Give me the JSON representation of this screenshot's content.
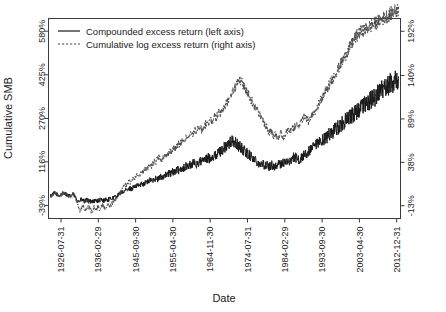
{
  "chart_data": {
    "type": "line",
    "title": "",
    "xlabel": "Date",
    "ylabel": "Cumulative SMB",
    "grid": false,
    "legend_position": "top-left",
    "x_tick_labels": [
      "1926-07-31",
      "1936-02-29",
      "1945-09-30",
      "1955-04-30",
      "1964-11-30",
      "1974-07-31",
      "1984-02-29",
      "1993-09-30",
      "2003-04-30",
      "2012-12-31"
    ],
    "y_left_tick_labels": [
      "-39%",
      "116%",
      "270%",
      "425%",
      "580%"
    ],
    "y_left_values": [
      -39,
      116,
      270,
      425,
      580
    ],
    "y_right_tick_labels": [
      "-13%",
      "38%",
      "89%",
      "140%",
      "192%"
    ],
    "y_right_values": [
      -13,
      38,
      89,
      140,
      192
    ],
    "ylim_left": [
      -85,
      625
    ],
    "ylim_right": [
      -28,
      207
    ],
    "series": [
      {
        "name": "Compounded excess return (left axis)",
        "axis": "left",
        "style": "solid",
        "color": "#1a1a1a",
        "values": [
          -5,
          -2,
          2,
          5,
          3,
          0,
          -4,
          -2,
          1,
          4,
          6,
          3,
          0,
          -3,
          -6,
          -4,
          -1,
          2,
          -8,
          -14,
          -20,
          -24,
          -22,
          -18,
          -21,
          -25,
          -23,
          -19,
          -22,
          -26,
          -24,
          -21,
          -24,
          -22,
          -20,
          -23,
          -21,
          -18,
          -20,
          -22,
          -19,
          -17,
          -20,
          -18,
          -16,
          -14,
          -12,
          -10,
          -8,
          -5,
          -2,
          2,
          6,
          10,
          8,
          12,
          16,
          14,
          18,
          22,
          20,
          24,
          28,
          26,
          30,
          34,
          32,
          36,
          40,
          38,
          42,
          46,
          44,
          48,
          52,
          50,
          54,
          58,
          56,
          52,
          56,
          60,
          64,
          62,
          66,
          70,
          68,
          72,
          76,
          74,
          78,
          82,
          80,
          84,
          88,
          86,
          90,
          94,
          92,
          96,
          100,
          98,
          102,
          106,
          104,
          108,
          112,
          110,
          106,
          110,
          114,
          118,
          116,
          120,
          124,
          122,
          126,
          130,
          128,
          132,
          136,
          134,
          138,
          142,
          146,
          150,
          154,
          158,
          162,
          166,
          170,
          174,
          178,
          182,
          186,
          190,
          186,
          182,
          178,
          174,
          170,
          166,
          162,
          158,
          154,
          150,
          146,
          142,
          138,
          134,
          130,
          126,
          122,
          118,
          114,
          110,
          106,
          110,
          106,
          102,
          106,
          102,
          98,
          102,
          106,
          102,
          98,
          102,
          106,
          110,
          106,
          110,
          114,
          110,
          114,
          118,
          114,
          118,
          122,
          126,
          130,
          134,
          130,
          126,
          122,
          126,
          130,
          134,
          138,
          142,
          146,
          150,
          154,
          158,
          162,
          166,
          170,
          174,
          178,
          182,
          186,
          190,
          194,
          198,
          202,
          206,
          210,
          214,
          218,
          222,
          226,
          230,
          234,
          238,
          242,
          246,
          250,
          254,
          258,
          262,
          266,
          270,
          274,
          278,
          282,
          286,
          290,
          294,
          298,
          302,
          306,
          310,
          314,
          318,
          322,
          326,
          330,
          334,
          338,
          342,
          346,
          350,
          354,
          358,
          362,
          366,
          370,
          374,
          378,
          382,
          386,
          390,
          394,
          398,
          402,
          406,
          410,
          414,
          418
        ]
      },
      {
        "name": "Cumulative log excess return (right axis)",
        "axis": "right",
        "style": "dashed",
        "color": "#4a4a4a",
        "values": [
          -2,
          -1,
          1,
          2,
          1,
          0,
          -2,
          -1,
          0,
          2,
          3,
          1,
          0,
          -2,
          -3,
          -2,
          0,
          1,
          -5,
          -9,
          -14,
          -18,
          -16,
          -13,
          -15,
          -19,
          -17,
          -14,
          -16,
          -20,
          -18,
          -15,
          -18,
          -16,
          -14,
          -17,
          -15,
          -12,
          -14,
          -16,
          -13,
          -11,
          -14,
          -12,
          -10,
          -8,
          -6,
          -4,
          -2,
          1,
          3,
          6,
          9,
          12,
          10,
          13,
          16,
          14,
          17,
          20,
          18,
          21,
          24,
          22,
          25,
          28,
          26,
          29,
          32,
          30,
          33,
          36,
          34,
          37,
          40,
          38,
          41,
          44,
          42,
          39,
          42,
          45,
          48,
          46,
          49,
          52,
          50,
          53,
          56,
          54,
          57,
          60,
          58,
          61,
          64,
          62,
          65,
          68,
          66,
          69,
          72,
          70,
          73,
          76,
          74,
          77,
          80,
          78,
          75,
          78,
          81,
          84,
          82,
          85,
          88,
          86,
          89,
          92,
          90,
          93,
          96,
          94,
          97,
          100,
          103,
          106,
          109,
          112,
          115,
          118,
          121,
          124,
          127,
          130,
          133,
          136,
          133,
          130,
          127,
          124,
          121,
          118,
          115,
          112,
          109,
          106,
          103,
          100,
          97,
          94,
          91,
          88,
          85,
          82,
          79,
          76,
          73,
          76,
          73,
          70,
          73,
          70,
          67,
          70,
          73,
          70,
          67,
          70,
          73,
          76,
          73,
          76,
          79,
          76,
          79,
          82,
          79,
          82,
          85,
          88,
          91,
          94,
          91,
          88,
          85,
          88,
          91,
          94,
          97,
          100,
          103,
          106,
          109,
          112,
          115,
          118,
          121,
          124,
          127,
          130,
          133,
          136,
          139,
          142,
          145,
          148,
          151,
          154,
          157,
          160,
          163,
          166,
          169,
          172,
          175,
          178,
          181,
          184,
          186,
          188,
          190,
          191,
          192,
          193,
          194,
          195,
          196,
          197,
          198,
          199,
          200,
          201,
          202,
          203,
          204,
          205,
          206,
          207,
          208,
          209,
          210,
          211,
          212,
          213,
          214,
          215,
          216,
          217,
          218
        ]
      }
    ]
  },
  "legend": {
    "items": [
      {
        "label": "Compounded excess return (left axis)",
        "style": "solid"
      },
      {
        "label": "Cumulative log excess return (right axis)",
        "style": "dashed"
      }
    ]
  }
}
